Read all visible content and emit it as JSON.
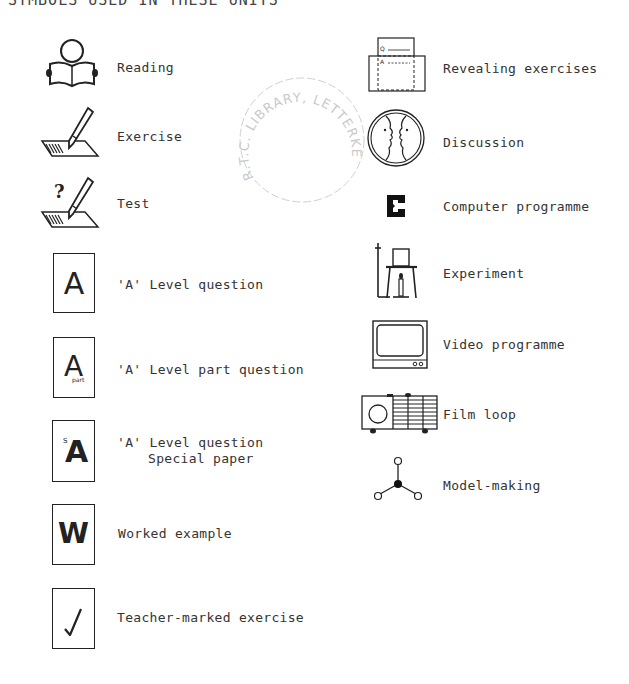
{
  "header": {
    "title": "SYMBOLS USED IN THESE UNITS"
  },
  "stamp": {
    "text": "R.T.C. LIBRARY, LETTERKENNY"
  },
  "left_column": [
    {
      "icon": "reading-icon",
      "label": "Reading"
    },
    {
      "icon": "exercise-icon",
      "label": "Exercise"
    },
    {
      "icon": "test-icon",
      "label": "Test"
    },
    {
      "icon": "a-level-question-icon",
      "glyph": "A",
      "label": "'A' Level question"
    },
    {
      "icon": "a-level-part-question-icon",
      "glyph": "A",
      "sub": "part",
      "label": "'A' Level part question"
    },
    {
      "icon": "a-level-special-paper-icon",
      "glyph": "A",
      "sup": "S",
      "label": "'A' Level question",
      "label2": "Special paper"
    },
    {
      "icon": "worked-example-icon",
      "glyph": "W",
      "label": "Worked example"
    },
    {
      "icon": "teacher-marked-icon",
      "glyph": "✓",
      "label": "Teacher-marked exercise"
    }
  ],
  "right_column": [
    {
      "icon": "revealing-exercises-icon",
      "q": "Q",
      "a": "A",
      "label": "Revealing exercises"
    },
    {
      "icon": "discussion-icon",
      "label": "Discussion"
    },
    {
      "icon": "computer-programme-icon",
      "glyph": "C",
      "label": "Computer programme"
    },
    {
      "icon": "experiment-icon",
      "label": "Experiment"
    },
    {
      "icon": "video-programme-icon",
      "label": "Video programme"
    },
    {
      "icon": "film-loop-icon",
      "label": "Film loop"
    },
    {
      "icon": "model-making-icon",
      "label": "Model-making"
    }
  ]
}
